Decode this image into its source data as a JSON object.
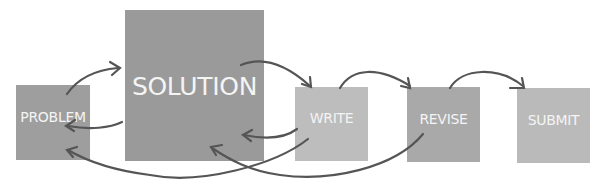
{
  "diagram": {
    "type": "process-flow",
    "nodes": [
      {
        "id": "problem",
        "label": "PROBLEM"
      },
      {
        "id": "solution",
        "label": "SOLUTION"
      },
      {
        "id": "write",
        "label": "WRITE"
      },
      {
        "id": "revise",
        "label": "REVISE"
      },
      {
        "id": "submit",
        "label": "SUBMIT"
      }
    ],
    "edges": [
      {
        "from": "problem",
        "to": "solution"
      },
      {
        "from": "solution",
        "to": "problem"
      },
      {
        "from": "solution",
        "to": "write"
      },
      {
        "from": "write",
        "to": "solution"
      },
      {
        "from": "write",
        "to": "problem"
      },
      {
        "from": "write",
        "to": "revise"
      },
      {
        "from": "revise",
        "to": "solution"
      },
      {
        "from": "revise",
        "to": "submit"
      }
    ]
  },
  "colors": {
    "box_dark": "#9a9a9a",
    "box_light": "#bdbdbd",
    "box_mid": "#a9a9a9",
    "arrow": "#555555",
    "label": "#f4f4f4"
  }
}
